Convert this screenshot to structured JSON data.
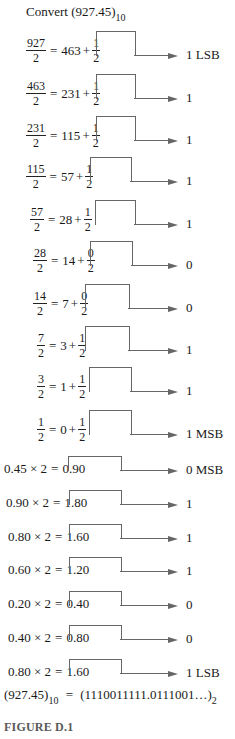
{
  "title": {
    "text": "Convert",
    "value": "(927.45)",
    "base": "10"
  },
  "integer_steps": [
    {
      "num": "927",
      "den": "2",
      "quot": "463",
      "rnum": "1",
      "rden": "2",
      "bit": "1 LSB"
    },
    {
      "num": "463",
      "den": "2",
      "quot": "231",
      "rnum": "1",
      "rden": "2",
      "bit": "1"
    },
    {
      "num": "231",
      "den": "2",
      "quot": "115",
      "rnum": "1",
      "rden": "2",
      "bit": "1"
    },
    {
      "num": "115",
      "den": "2",
      "quot": "57",
      "rnum": "1",
      "rden": "2",
      "bit": "1"
    },
    {
      "num": "57",
      "den": "2",
      "quot": "28",
      "rnum": "1",
      "rden": "2",
      "bit": "1"
    },
    {
      "num": "28",
      "den": "2",
      "quot": "14",
      "rnum": "0",
      "rden": "2",
      "bit": "0"
    },
    {
      "num": "14",
      "den": "2",
      "quot": "7",
      "rnum": "0",
      "rden": "2",
      "bit": "0"
    },
    {
      "num": "7",
      "den": "2",
      "quot": "3",
      "rnum": "1",
      "rden": "2",
      "bit": "1"
    },
    {
      "num": "3",
      "den": "2",
      "quot": "1",
      "rnum": "1",
      "rden": "2",
      "bit": "1"
    },
    {
      "num": "1",
      "den": "2",
      "quot": "0",
      "rnum": "1",
      "rden": "2",
      "bit": "1 MSB"
    }
  ],
  "fraction_steps": [
    {
      "lhs": "0.45 × 2",
      "rhs": "0.90",
      "bit": "0 MSB"
    },
    {
      "lhs": "0.90 × 2",
      "rhs": "1.80",
      "bit": "1"
    },
    {
      "lhs": "0.80 × 2",
      "rhs": "1.60",
      "bit": "1"
    },
    {
      "lhs": "0.60 × 2",
      "rhs": "1.20",
      "bit": "1"
    },
    {
      "lhs": "0.20 × 2",
      "rhs": "0.40",
      "bit": "0"
    },
    {
      "lhs": "0.40 × 2",
      "rhs": "0.80",
      "bit": "0"
    },
    {
      "lhs": "0.80 × 2",
      "rhs": "1.60",
      "bit": "1 LSB"
    }
  ],
  "symbols": {
    "equals": "=",
    "plus": "+"
  },
  "result": {
    "lhs": "(927.45)",
    "lhs_base": "10",
    "equals": "=",
    "rhs": "(1110011111.0111001…)",
    "rhs_base": "2"
  },
  "caption": "FIGURE D.1"
}
